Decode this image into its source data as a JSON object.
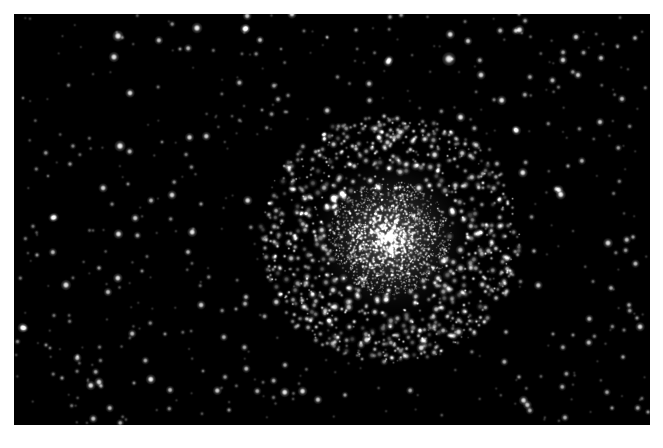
{
  "image": {
    "kind": "astrophotograph",
    "subject_name": "globular-star-cluster",
    "width": 663,
    "height": 448,
    "border": {
      "color": "#ffffff",
      "left": 14,
      "top": 14,
      "right": 13,
      "bottom": 23
    },
    "sky": {
      "background_color": "#000000",
      "x": 14,
      "y": 14,
      "width": 636,
      "height": 411
    },
    "star_color": "#ffffff",
    "palette": {
      "background": "#000000",
      "frame": "#ffffff",
      "star_bright": "#ffffff",
      "star_mid": "#cfcfcf",
      "star_faint": "#6e6e6e",
      "halo_glow": "#9a9a9a"
    }
  },
  "chart_data": {
    "type": "scatter",
    "title": "",
    "xlabel": "",
    "ylabel": "",
    "cluster": {
      "center_x": 390,
      "center_y": 238,
      "core_radius": 30,
      "dense_radius": 58,
      "halo_radius": 125,
      "core_star_count": 1500,
      "halo_star_count": 900,
      "glow_opacity": 0.3
    },
    "field": {
      "star_count": 520,
      "min_size": 1.0,
      "max_size": 4.2
    },
    "bright_field_stars": [
      {
        "x": 118,
        "y": 36,
        "r": 2.6,
        "b": 1.0
      },
      {
        "x": 114,
        "y": 57,
        "r": 2.4,
        "b": 0.95
      },
      {
        "x": 130,
        "y": 93,
        "r": 2.2,
        "b": 0.92
      },
      {
        "x": 180,
        "y": 49,
        "r": 1.4,
        "b": 0.55
      },
      {
        "x": 245,
        "y": 29,
        "r": 2.3,
        "b": 0.95
      },
      {
        "x": 260,
        "y": 40,
        "r": 1.9,
        "b": 0.8
      },
      {
        "x": 292,
        "y": 14,
        "r": 2.2,
        "b": 0.9
      },
      {
        "x": 197,
        "y": 28,
        "r": 2.5,
        "b": 1.0
      },
      {
        "x": 356,
        "y": 30,
        "r": 1.5,
        "b": 0.6
      },
      {
        "x": 390,
        "y": 17,
        "r": 1.6,
        "b": 0.6
      },
      {
        "x": 388,
        "y": 62,
        "r": 2.2,
        "b": 0.9
      },
      {
        "x": 449,
        "y": 59,
        "r": 3.2,
        "b": 1.0
      },
      {
        "x": 468,
        "y": 41,
        "r": 2.0,
        "b": 0.85
      },
      {
        "x": 481,
        "y": 75,
        "r": 2.2,
        "b": 0.9
      },
      {
        "x": 563,
        "y": 60,
        "r": 2.1,
        "b": 0.88
      },
      {
        "x": 576,
        "y": 37,
        "r": 2.0,
        "b": 0.85
      },
      {
        "x": 601,
        "y": 58,
        "r": 1.9,
        "b": 0.8
      },
      {
        "x": 635,
        "y": 38,
        "r": 1.7,
        "b": 0.7
      },
      {
        "x": 578,
        "y": 75,
        "r": 2.0,
        "b": 0.85
      },
      {
        "x": 70,
        "y": 164,
        "r": 1.6,
        "b": 0.6
      },
      {
        "x": 120,
        "y": 146,
        "r": 2.6,
        "b": 1.0
      },
      {
        "x": 162,
        "y": 142,
        "r": 1.3,
        "b": 0.5
      },
      {
        "x": 172,
        "y": 195,
        "r": 2.2,
        "b": 0.9
      },
      {
        "x": 128,
        "y": 184,
        "r": 1.4,
        "b": 0.55
      },
      {
        "x": 201,
        "y": 204,
        "r": 1.5,
        "b": 0.6
      },
      {
        "x": 37,
        "y": 255,
        "r": 1.5,
        "b": 0.6
      },
      {
        "x": 66,
        "y": 285,
        "r": 2.4,
        "b": 0.95
      },
      {
        "x": 99,
        "y": 268,
        "r": 1.6,
        "b": 0.65
      },
      {
        "x": 108,
        "y": 292,
        "r": 2.0,
        "b": 0.8
      },
      {
        "x": 142,
        "y": 271,
        "r": 1.4,
        "b": 0.55
      },
      {
        "x": 188,
        "y": 252,
        "r": 1.8,
        "b": 0.75
      },
      {
        "x": 46,
        "y": 345,
        "r": 1.4,
        "b": 0.55
      },
      {
        "x": 50,
        "y": 348,
        "r": 1.3,
        "b": 0.5
      },
      {
        "x": 62,
        "y": 378,
        "r": 1.5,
        "b": 0.6
      },
      {
        "x": 99,
        "y": 382,
        "r": 2.2,
        "b": 0.9
      },
      {
        "x": 134,
        "y": 383,
        "r": 1.4,
        "b": 0.55
      },
      {
        "x": 101,
        "y": 386,
        "r": 1.6,
        "b": 0.65
      },
      {
        "x": 165,
        "y": 334,
        "r": 1.4,
        "b": 0.55
      },
      {
        "x": 265,
        "y": 248,
        "r": 1.5,
        "b": 0.6
      },
      {
        "x": 246,
        "y": 297,
        "r": 1.8,
        "b": 0.75
      },
      {
        "x": 236,
        "y": 309,
        "r": 1.4,
        "b": 0.55
      },
      {
        "x": 285,
        "y": 365,
        "r": 1.8,
        "b": 0.7
      },
      {
        "x": 345,
        "y": 395,
        "r": 1.6,
        "b": 0.65
      },
      {
        "x": 229,
        "y": 410,
        "r": 1.5,
        "b": 0.6
      },
      {
        "x": 420,
        "y": 331,
        "r": 1.8,
        "b": 0.7
      },
      {
        "x": 451,
        "y": 336,
        "r": 1.5,
        "b": 0.6
      },
      {
        "x": 506,
        "y": 332,
        "r": 1.6,
        "b": 0.65
      },
      {
        "x": 553,
        "y": 334,
        "r": 1.4,
        "b": 0.55
      },
      {
        "x": 573,
        "y": 335,
        "r": 1.4,
        "b": 0.55
      },
      {
        "x": 519,
        "y": 377,
        "r": 1.5,
        "b": 0.6
      },
      {
        "x": 608,
        "y": 243,
        "r": 2.3,
        "b": 0.92
      },
      {
        "x": 633,
        "y": 237,
        "r": 1.6,
        "b": 0.65
      },
      {
        "x": 611,
        "y": 288,
        "r": 1.8,
        "b": 0.7
      },
      {
        "x": 629,
        "y": 305,
        "r": 1.7,
        "b": 0.68
      },
      {
        "x": 637,
        "y": 318,
        "r": 1.5,
        "b": 0.6
      },
      {
        "x": 623,
        "y": 357,
        "r": 1.6,
        "b": 0.65
      },
      {
        "x": 612,
        "y": 408,
        "r": 1.5,
        "b": 0.6
      },
      {
        "x": 648,
        "y": 412,
        "r": 1.5,
        "b": 0.6
      },
      {
        "x": 568,
        "y": 166,
        "r": 1.5,
        "b": 0.6
      },
      {
        "x": 519,
        "y": 14,
        "r": 1.4,
        "b": 0.55
      },
      {
        "x": 600,
        "y": 122,
        "r": 2.0,
        "b": 0.82
      },
      {
        "x": 534,
        "y": 251,
        "r": 1.6,
        "b": 0.65
      },
      {
        "x": 281,
        "y": 49,
        "r": 1.2,
        "b": 0.45
      },
      {
        "x": 327,
        "y": 37,
        "r": 1.3,
        "b": 0.5
      },
      {
        "x": 262,
        "y": 110,
        "r": 1.3,
        "b": 0.5
      },
      {
        "x": 23,
        "y": 98,
        "r": 1.2,
        "b": 0.45
      },
      {
        "x": 48,
        "y": 176,
        "r": 1.2,
        "b": 0.45
      },
      {
        "x": 203,
        "y": 371,
        "r": 1.3,
        "b": 0.5
      }
    ],
    "legend_position": "none",
    "grid": false
  }
}
